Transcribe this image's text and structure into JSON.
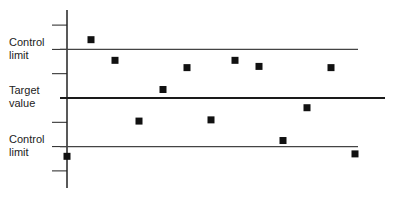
{
  "chart_data": {
    "type": "scatter",
    "title": "",
    "xlabel": "",
    "ylabel": "",
    "annotations": [
      "Control limit",
      "Target value",
      "Control limit"
    ],
    "reference_lines": [
      {
        "name": "Upper control limit",
        "y": 2
      },
      {
        "name": "Target value",
        "y": 0
      },
      {
        "name": "Lower control limit",
        "y": -2
      }
    ],
    "y_ticks": [
      3,
      2,
      1,
      0,
      -1,
      -2,
      -3
    ],
    "ylim": [
      -3.7,
      3.6
    ],
    "grid": false,
    "legend": null,
    "series": [
      {
        "name": "Measurements",
        "x": [
          0,
          1,
          2,
          3,
          4,
          5,
          6,
          7,
          8,
          9,
          10,
          11,
          12
        ],
        "values": [
          -2.4,
          2.4,
          1.55,
          -0.95,
          0.35,
          1.25,
          -0.9,
          1.55,
          1.3,
          -1.75,
          -0.4,
          1.25,
          -2.3
        ]
      }
    ]
  },
  "labels": {
    "upper": "Control\nlimit",
    "target": "Target\nvalue",
    "lower": "Control\nlimit"
  },
  "colors": {
    "axis": "#222222",
    "line": "#444444",
    "target_line": "#1a1a1a",
    "marker": "#111111"
  }
}
